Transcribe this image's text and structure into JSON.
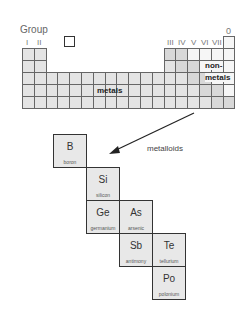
{
  "periodic_table": {
    "group_label": "Group",
    "groups_left": [
      "I",
      "II"
    ],
    "groups_right": [
      "III",
      "IV",
      "V",
      "VI",
      "VII"
    ],
    "group_zero": "0",
    "region_labels": {
      "metals": "metals",
      "nonmetals_line1": "non-",
      "nonmetals_line2": "metals"
    }
  },
  "arrow_label": "metalloids",
  "metalloids": [
    {
      "symbol": "B",
      "name": "boron"
    },
    {
      "symbol": "Si",
      "name": "silicon"
    },
    {
      "symbol": "Ge",
      "name": "germanium"
    },
    {
      "symbol": "As",
      "name": "arsenic"
    },
    {
      "symbol": "Sb",
      "name": "antimony"
    },
    {
      "symbol": "Te",
      "name": "tellurium"
    },
    {
      "symbol": "Po",
      "name": "polonium"
    }
  ]
}
